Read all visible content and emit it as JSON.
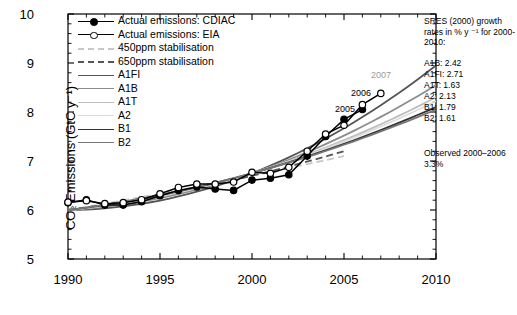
{
  "chart_data": {
    "type": "line",
    "title": "",
    "xlabel": "",
    "ylabel": "CO2 Emissions (GtC y-1)",
    "xlim": [
      1990,
      2010
    ],
    "ylim": [
      5,
      10
    ],
    "xticks": [
      1990,
      1995,
      2000,
      2005,
      2010
    ],
    "yticks": [
      5,
      6,
      7,
      8,
      9,
      10
    ],
    "grid": false,
    "legend_position": "upper-left-inside",
    "series": [
      {
        "name": "Actual emissions: CDIAC",
        "style": "line-filled-circles",
        "color": "#000000",
        "x": [
          1990,
          1991,
          1992,
          1993,
          1994,
          1995,
          1996,
          1997,
          1998,
          1999,
          2000,
          2001,
          2002,
          2003,
          2004,
          2005,
          2006
        ],
        "values": [
          6.15,
          6.21,
          6.1,
          6.1,
          6.17,
          6.29,
          6.4,
          6.47,
          6.43,
          6.4,
          6.61,
          6.65,
          6.72,
          7.1,
          7.5,
          7.85,
          8.05
        ]
      },
      {
        "name": "Actual emissions: EIA",
        "style": "line-open-circles",
        "color": "#000000",
        "x": [
          1990,
          1991,
          1992,
          1993,
          1994,
          1995,
          1996,
          1997,
          1998,
          1999,
          2000,
          2001,
          2002,
          2003,
          2004,
          2005,
          2006,
          2007
        ],
        "values": [
          6.16,
          6.19,
          6.13,
          6.15,
          6.21,
          6.33,
          6.46,
          6.53,
          6.53,
          6.57,
          6.77,
          6.75,
          6.87,
          7.2,
          7.55,
          7.73,
          8.15,
          8.38
        ]
      },
      {
        "name": "450ppm stabilisation",
        "style": "dashed",
        "color": "#c8c8c8",
        "x": [
          1990,
          2000,
          2005,
          2010
        ],
        "values": [
          6.0,
          6.7,
          7.1,
          7.45
        ]
      },
      {
        "name": "650ppm stabilisation",
        "style": "dashed",
        "color": "#555555",
        "x": [
          1990,
          2000,
          2005,
          2010
        ],
        "values": [
          6.0,
          6.7,
          7.2,
          7.62
        ]
      },
      {
        "name": "A1FI",
        "style": "solid",
        "color": "#555555",
        "x": [
          1990,
          2000,
          2010
        ],
        "values": [
          6.0,
          6.75,
          8.95
        ]
      },
      {
        "name": "A1B",
        "style": "solid",
        "color": "#8c8c8c",
        "x": [
          1990,
          2000,
          2010
        ],
        "values": [
          6.0,
          6.75,
          8.55
        ]
      },
      {
        "name": "A1T",
        "style": "solid",
        "color": "#bdbdbd",
        "x": [
          1990,
          2000,
          2010
        ],
        "values": [
          6.0,
          6.75,
          8.3
        ]
      },
      {
        "name": "A2",
        "style": "solid",
        "color": "#dcdcdc",
        "x": [
          1990,
          2000,
          2010
        ],
        "values": [
          6.0,
          6.75,
          8.22
        ]
      },
      {
        "name": "B1",
        "style": "solid",
        "color": "#333333",
        "x": [
          1990,
          2000,
          2010
        ],
        "values": [
          6.0,
          6.75,
          8.1
        ]
      },
      {
        "name": "B2",
        "style": "solid",
        "color": "#777777",
        "x": [
          1990,
          2000,
          2010
        ],
        "values": [
          6.0,
          6.75,
          8.05
        ]
      }
    ],
    "annotations": [
      {
        "text": "2005",
        "x": 2004.0,
        "y": 7.95,
        "color": "#000000"
      },
      {
        "text": "2006",
        "x": 2004.9,
        "y": 8.3,
        "color": "#000000"
      },
      {
        "text": "2007",
        "x": 2005.9,
        "y": 8.72,
        "color": "#9a9a9a"
      }
    ]
  },
  "axis": {
    "ylabel": "CO₂ Emissions (GtC y⁻¹)",
    "yticks": [
      "10",
      "9",
      "8",
      "7",
      "6",
      "5"
    ],
    "xticks": [
      "1990",
      "1995",
      "2000",
      "2005",
      "2010"
    ]
  },
  "legend": {
    "items": [
      {
        "label": "Actual emissions: CDIAC",
        "key": "line-filled-circle",
        "color": "#000000"
      },
      {
        "label": "Actual emissions: EIA",
        "key": "line-open-circle",
        "color": "#000000"
      },
      {
        "label": "450ppm stabilisation",
        "key": "dashed",
        "color": "#c8c8c8"
      },
      {
        "label": "650ppm stabilisation",
        "key": "dashed",
        "color": "#555555"
      },
      {
        "label": "A1FI",
        "key": "solid",
        "color": "#555555"
      },
      {
        "label": "A1B",
        "key": "solid",
        "color": "#8c8c8c"
      },
      {
        "label": "A1T",
        "key": "solid",
        "color": "#bdbdbd"
      },
      {
        "label": "A2",
        "key": "solid",
        "color": "#dcdcdc"
      },
      {
        "label": "B1",
        "key": "solid",
        "color": "#333333"
      },
      {
        "label": "B2",
        "key": "solid",
        "color": "#777777"
      }
    ]
  },
  "right_panel": {
    "heading": "SRES (2000) growth rates in % y ⁻¹ for 2000-2010:",
    "rates": [
      "A1B: 2.42",
      "A1FI: 2.71",
      "A1T: 1.63",
      "A2: 2.13",
      "B1: 1.79",
      "B2: 1.61"
    ],
    "observed": "Observed 2000–2006 3.3%"
  },
  "point_labels": {
    "y2005": "2005",
    "y2006": "2006",
    "y2007": "2007"
  }
}
